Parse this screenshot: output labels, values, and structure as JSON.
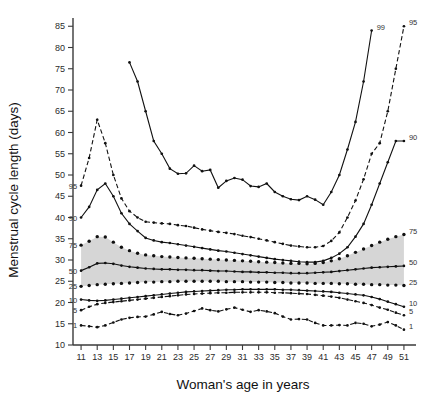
{
  "chart_data": {
    "type": "line",
    "title": "",
    "xlabel": "Woman's age in years",
    "ylabel": "Menstrual cycle length (days)",
    "xlim": [
      10,
      52
    ],
    "ylim": [
      10,
      86
    ],
    "xticks": [
      11,
      13,
      15,
      17,
      19,
      21,
      23,
      25,
      27,
      29,
      31,
      33,
      35,
      37,
      39,
      41,
      43,
      45,
      47,
      49,
      51
    ],
    "yticks": [
      10,
      15,
      20,
      25,
      30,
      35,
      40,
      45,
      50,
      55,
      60,
      65,
      70,
      75,
      80,
      85
    ],
    "grid": false,
    "legend_position": "inline-endpoints",
    "band": {
      "lower_series": "25",
      "upper_series": "75",
      "color": "#cfcfcf",
      "note": "shaded interquartile range"
    },
    "x": [
      11,
      12,
      13,
      14,
      15,
      16,
      17,
      18,
      19,
      20,
      21,
      22,
      23,
      24,
      25,
      26,
      27,
      28,
      29,
      30,
      31,
      32,
      33,
      34,
      35,
      36,
      37,
      38,
      39,
      40,
      41,
      42,
      43,
      44,
      45,
      46,
      47,
      48,
      49,
      50,
      51
    ],
    "series": [
      {
        "name": "99",
        "label_left": "",
        "label_right": "99",
        "style": "solid",
        "x": [
          17,
          18,
          19,
          20,
          21,
          22,
          23,
          24,
          25,
          26,
          27,
          28,
          29,
          30,
          31,
          32,
          33,
          34,
          35,
          36,
          37,
          38,
          39,
          40,
          41,
          42,
          43,
          44,
          45,
          46,
          47
        ],
        "values": [
          76.5,
          72.0,
          65.0,
          58.0,
          55.0,
          51.5,
          50.3,
          50.4,
          52.2,
          50.9,
          51.2,
          47.0,
          48.6,
          49.3,
          48.9,
          47.4,
          47.2,
          48.0,
          46.0,
          45.0,
          44.3,
          44.1,
          45.0,
          44.2,
          43.0,
          46.0,
          50.0,
          56.0,
          62.5,
          72.0,
          84.0
        ]
      },
      {
        "name": "95",
        "label_left": "95",
        "label_right": "95",
        "style": "dashed",
        "x": [
          11,
          12,
          13,
          14,
          15,
          16,
          17,
          18,
          19,
          20,
          21,
          22,
          23,
          24,
          25,
          26,
          27,
          28,
          29,
          30,
          31,
          32,
          33,
          34,
          35,
          36,
          37,
          38,
          39,
          40,
          41,
          42,
          43,
          44,
          45,
          46,
          47,
          48,
          49,
          50,
          51
        ],
        "values": [
          47.5,
          54.0,
          63.0,
          57.5,
          50.0,
          44.5,
          41.5,
          40.0,
          39.0,
          38.8,
          38.6,
          38.5,
          38.2,
          38.0,
          37.6,
          37.2,
          36.9,
          36.6,
          36.4,
          36.1,
          35.7,
          35.4,
          35.0,
          34.6,
          34.2,
          33.8,
          33.4,
          33.2,
          33.0,
          33.0,
          33.3,
          34.5,
          36.5,
          40.0,
          44.0,
          49.0,
          55.0,
          57.5,
          65.0,
          75.0,
          85.0
        ]
      },
      {
        "name": "90",
        "label_left": "90",
        "label_right": "90",
        "style": "solid",
        "x": [
          11,
          12,
          13,
          14,
          15,
          16,
          17,
          18,
          19,
          20,
          21,
          22,
          23,
          24,
          25,
          26,
          27,
          28,
          29,
          30,
          31,
          32,
          33,
          34,
          35,
          36,
          37,
          38,
          39,
          40,
          41,
          42,
          43,
          44,
          45,
          46,
          47,
          48,
          49,
          50,
          51
        ],
        "values": [
          40.0,
          42.5,
          46.5,
          48.0,
          45.0,
          41.0,
          38.5,
          36.8,
          35.2,
          34.6,
          34.2,
          34.0,
          33.7,
          33.4,
          33.1,
          32.8,
          32.5,
          32.2,
          32.0,
          31.7,
          31.4,
          31.1,
          30.8,
          30.5,
          30.2,
          30.0,
          29.8,
          29.6,
          29.5,
          29.5,
          29.8,
          30.5,
          31.5,
          33.0,
          35.5,
          38.5,
          43.0,
          48.0,
          53.0,
          58.0,
          58.0
        ]
      },
      {
        "name": "75",
        "label_left": "75",
        "label_right": "75",
        "style": "dotted-solid",
        "x": [
          11,
          12,
          13,
          14,
          15,
          16,
          17,
          18,
          19,
          20,
          21,
          22,
          23,
          24,
          25,
          26,
          27,
          28,
          29,
          30,
          31,
          32,
          33,
          34,
          35,
          36,
          37,
          38,
          39,
          40,
          41,
          42,
          43,
          44,
          45,
          46,
          47,
          48,
          49,
          50,
          51
        ],
        "values": [
          33.5,
          34.4,
          35.5,
          35.4,
          34.2,
          33.0,
          32.2,
          31.6,
          31.2,
          31.0,
          30.8,
          30.7,
          30.6,
          30.5,
          30.4,
          30.3,
          30.2,
          30.1,
          30.0,
          29.9,
          29.8,
          29.7,
          29.6,
          29.5,
          29.4,
          29.3,
          29.2,
          29.2,
          29.1,
          29.2,
          29.4,
          29.8,
          30.3,
          31.0,
          31.8,
          32.6,
          33.4,
          34.2,
          34.9,
          35.5,
          36.0
        ]
      },
      {
        "name": "50",
        "label_left": "50",
        "label_right": "50",
        "style": "solid",
        "x": [
          11,
          12,
          13,
          14,
          15,
          16,
          17,
          18,
          19,
          20,
          21,
          22,
          23,
          24,
          25,
          26,
          27,
          28,
          29,
          30,
          31,
          32,
          33,
          34,
          35,
          36,
          37,
          38,
          39,
          40,
          41,
          42,
          43,
          44,
          45,
          46,
          47,
          48,
          49,
          50,
          51
        ],
        "values": [
          27.5,
          28.3,
          29.2,
          29.3,
          29.1,
          28.7,
          28.4,
          28.2,
          28.0,
          27.9,
          27.8,
          27.8,
          27.7,
          27.7,
          27.6,
          27.6,
          27.5,
          27.4,
          27.4,
          27.3,
          27.2,
          27.2,
          27.1,
          27.1,
          27.0,
          27.0,
          26.9,
          26.9,
          26.9,
          27.0,
          27.1,
          27.2,
          27.4,
          27.6,
          27.8,
          28.0,
          28.2,
          28.3,
          28.4,
          28.5,
          28.6
        ]
      },
      {
        "name": "25",
        "label_left": "25",
        "label_right": "25",
        "style": "dotted-solid",
        "x": [
          11,
          12,
          13,
          14,
          15,
          16,
          17,
          18,
          19,
          20,
          21,
          22,
          23,
          24,
          25,
          26,
          27,
          28,
          29,
          30,
          31,
          32,
          33,
          34,
          35,
          36,
          37,
          38,
          39,
          40,
          41,
          42,
          43,
          44,
          45,
          46,
          47,
          48,
          49,
          50,
          51
        ],
        "values": [
          23.8,
          24.0,
          24.2,
          24.3,
          24.4,
          24.5,
          24.6,
          24.7,
          24.8,
          24.8,
          24.9,
          24.9,
          25.0,
          25.0,
          25.0,
          25.0,
          25.0,
          25.0,
          24.9,
          24.9,
          24.9,
          24.8,
          24.8,
          24.8,
          24.7,
          24.7,
          24.6,
          24.6,
          24.6,
          24.5,
          24.5,
          24.5,
          24.4,
          24.4,
          24.3,
          24.3,
          24.2,
          24.2,
          24.1,
          24.1,
          24.0
        ]
      },
      {
        "name": "10",
        "label_left": "10",
        "label_right": "10",
        "style": "solid",
        "x": [
          11,
          12,
          13,
          14,
          15,
          16,
          17,
          18,
          19,
          20,
          21,
          22,
          23,
          24,
          25,
          26,
          27,
          28,
          29,
          30,
          31,
          32,
          33,
          34,
          35,
          36,
          37,
          38,
          39,
          40,
          41,
          42,
          43,
          44,
          45,
          46,
          47,
          48,
          49,
          50,
          51
        ],
        "values": [
          20.7,
          20.5,
          20.4,
          20.5,
          20.7,
          20.9,
          21.1,
          21.3,
          21.5,
          21.7,
          21.9,
          22.1,
          22.3,
          22.5,
          22.6,
          22.7,
          22.8,
          22.9,
          23.0,
          23.0,
          23.1,
          23.1,
          23.1,
          23.1,
          23.1,
          23.0,
          23.0,
          22.9,
          22.8,
          22.7,
          22.6,
          22.5,
          22.3,
          22.1,
          21.9,
          21.7,
          21.3,
          20.8,
          20.2,
          19.6,
          19.0
        ]
      },
      {
        "name": "5",
        "label_left": "5",
        "label_right": "5",
        "style": "dashed",
        "x": [
          11,
          12,
          13,
          14,
          15,
          16,
          17,
          18,
          19,
          20,
          21,
          22,
          23,
          24,
          25,
          26,
          27,
          28,
          29,
          30,
          31,
          32,
          33,
          34,
          35,
          36,
          37,
          38,
          39,
          40,
          41,
          42,
          43,
          44,
          45,
          46,
          47,
          48,
          49,
          50,
          51
        ],
        "values": [
          18.2,
          19.0,
          19.6,
          19.9,
          20.1,
          20.3,
          20.5,
          20.7,
          20.9,
          21.1,
          21.3,
          21.5,
          21.7,
          21.9,
          22.0,
          22.1,
          22.2,
          22.3,
          22.3,
          22.4,
          22.4,
          22.4,
          22.4,
          22.4,
          22.3,
          22.3,
          22.2,
          22.1,
          22.0,
          21.8,
          21.6,
          21.4,
          21.1,
          20.7,
          20.3,
          19.9,
          19.4,
          18.8,
          18.3,
          17.6,
          17.0
        ]
      },
      {
        "name": "1",
        "label_left": "1",
        "label_right": "1",
        "style": "dashed",
        "x": [
          11,
          12,
          13,
          14,
          15,
          16,
          17,
          18,
          19,
          20,
          21,
          22,
          23,
          24,
          25,
          26,
          27,
          28,
          29,
          30,
          31,
          32,
          33,
          34,
          35,
          36,
          37,
          38,
          39,
          40,
          41,
          42,
          43,
          44,
          45,
          46,
          47,
          48,
          49,
          50,
          51
        ],
        "values": [
          14.6,
          14.4,
          14.2,
          14.6,
          15.3,
          16.0,
          16.4,
          16.6,
          16.7,
          17.2,
          17.8,
          17.3,
          17.0,
          17.4,
          18.0,
          18.6,
          18.2,
          17.9,
          18.4,
          18.8,
          18.3,
          17.8,
          18.2,
          17.9,
          17.5,
          16.7,
          16.0,
          16.1,
          16.0,
          15.2,
          14.6,
          14.6,
          14.7,
          14.6,
          15.2,
          15.0,
          14.4,
          14.8,
          15.4,
          14.6,
          13.6
        ]
      }
    ]
  }
}
